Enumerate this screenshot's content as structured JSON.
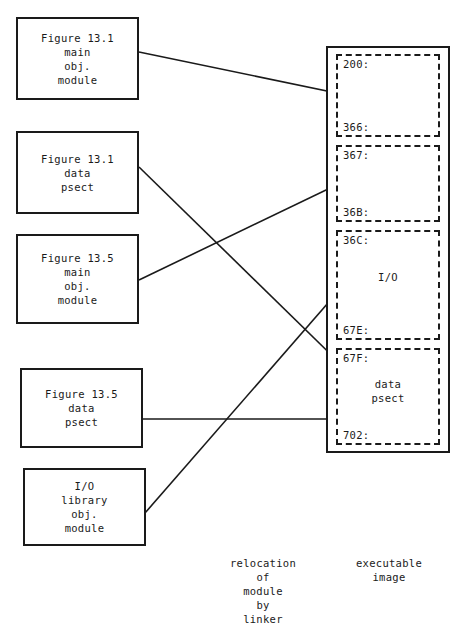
{
  "figure": {
    "title_caption_left": "relocation of module by linker",
    "title_caption_right": "executable image"
  },
  "modules": [
    {
      "id": "fig131-main",
      "lines": [
        "Figure 13.1",
        "main",
        "obj.",
        "module"
      ]
    },
    {
      "id": "fig131-data",
      "lines": [
        "Figure 13.1",
        "data",
        "psect"
      ]
    },
    {
      "id": "fig135-main",
      "lines": [
        "Figure 13.5",
        "main",
        "obj.",
        "module"
      ]
    },
    {
      "id": "fig135-data",
      "lines": [
        "Figure 13.5",
        "data",
        "psect"
      ]
    },
    {
      "id": "io-library",
      "lines": [
        "I/O",
        "library",
        "obj.",
        "module"
      ]
    }
  ],
  "memory_map": {
    "blocks": [
      {
        "id": "block-200",
        "start_addr": "200:",
        "end_addr": "366:",
        "label": ""
      },
      {
        "id": "block-367",
        "start_addr": "367:",
        "end_addr": "36B:",
        "label": ""
      },
      {
        "id": "block-36C",
        "start_addr": "36C:",
        "end_addr": "67E:",
        "label": "I/O"
      },
      {
        "id": "block-67F",
        "start_addr": "67F:",
        "end_addr": "702:",
        "label": "data\npsect"
      }
    ]
  },
  "captions": {
    "left": [
      "relocation",
      "of",
      "module",
      "by",
      "linker"
    ],
    "right": [
      "executable",
      "image"
    ]
  },
  "colors": {
    "ink": "#1a1a1a",
    "paper": "#ffffff"
  }
}
